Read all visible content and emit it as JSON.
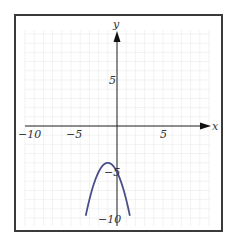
{
  "chart_data": {
    "type": "line",
    "title": "",
    "xlabel": "x",
    "ylabel": "y",
    "xlim": [
      -10,
      10
    ],
    "ylim": [
      -10,
      10
    ],
    "grid": true,
    "x_tick_labels": [
      "-10",
      "-5",
      "5"
    ],
    "y_tick_labels": [
      "5",
      "-5",
      "-10"
    ],
    "series": [
      {
        "name": "parabola",
        "equation": "y = -(x+1)^2 - 4",
        "color": "#4a4f8a",
        "x": [
          -3.4,
          -3,
          -2.5,
          -2,
          -1.5,
          -1,
          -0.5,
          0,
          0.5,
          1,
          1.4
        ],
        "y": [
          -9.76,
          -8,
          -6.25,
          -5,
          -4.25,
          -4,
          -4.25,
          -5,
          -6.25,
          -8,
          -9.76
        ]
      }
    ],
    "annotations": {
      "vertex": [
        -1,
        -4
      ],
      "y_intercept": [
        0,
        -5
      ]
    }
  },
  "labels": {
    "x_axis": "x",
    "y_axis": "y",
    "x_neg10": "−10",
    "x_neg5": "−5",
    "x_5": "5",
    "y_5": "5",
    "y_neg5": "−5",
    "y_neg10": "−10"
  },
  "colors": {
    "curve": "#4a4f8a",
    "axis": "#222222",
    "grid": "#ececec",
    "frame": "#3a3a3a"
  }
}
